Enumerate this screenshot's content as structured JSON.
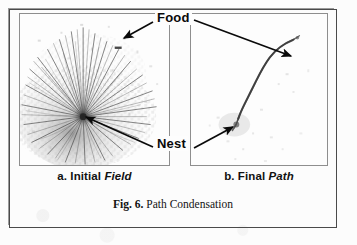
{
  "figure": {
    "caption_number": "Fig. 6.",
    "caption_text": " Path Condensation"
  },
  "panels": [
    {
      "id": "field",
      "caption_prefix": "a. Initial ",
      "caption_emphasis": "Field",
      "content_description": "radial starburst of many ant trails emanating from a central nest hub on a speckled grey field"
    },
    {
      "id": "path",
      "caption_prefix": "b. Final ",
      "caption_emphasis": "Path",
      "content_description": "single condensed dark trail running from lower-left nest up to upper-right food source"
    }
  ],
  "annotations": [
    {
      "id": "food",
      "label": "Food",
      "arrow_targets": [
        "initial-field-food-site",
        "final-path-food-end"
      ]
    },
    {
      "id": "nest",
      "label": "Nest",
      "arrow_targets": [
        "initial-field-nest-hub",
        "final-path-nest-end"
      ]
    }
  ],
  "colors": {
    "ink": "#0a0a0a",
    "frame": "#4a4a4a",
    "panel_border": "#8e8e8e",
    "page": "#fcfcfc",
    "field_grey": "#b9b9b9",
    "trail": "#3a3a3a"
  }
}
